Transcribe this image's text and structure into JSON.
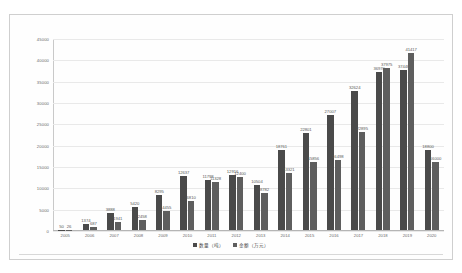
{
  "chart_data": {
    "type": "bar",
    "title": "",
    "xlabel": "",
    "ylabel": "",
    "ylim": [
      0,
      45000
    ],
    "grid": true,
    "legend_position": "bottom",
    "categories": [
      "2005",
      "2006",
      "2007",
      "2008",
      "2009",
      "2010",
      "2011",
      "2012",
      "2013",
      "2014",
      "2015",
      "2016",
      "2017",
      "2018",
      "2019",
      "2020"
    ],
    "yticks": [
      "0",
      "5000",
      "10000",
      "15000",
      "20000",
      "25000",
      "30000",
      "35000",
      "40000",
      "45000"
    ],
    "ytick_values": [
      0,
      5000,
      10000,
      15000,
      20000,
      25000,
      30000,
      35000,
      40000,
      45000
    ],
    "series": [
      {
        "name": "数量（吨）",
        "color": "#4a4a4a",
        "values": [
          50,
          1374,
          3888,
          5420,
          8295,
          12637,
          11798,
          12916,
          10504,
          18761,
          22801,
          27007,
          32624,
          36970,
          37448,
          18800
        ],
        "labels": [
          "50",
          "1374",
          "3888",
          "5420",
          "8295",
          "12637",
          "11798",
          "12916",
          "10504",
          "18761",
          "22801",
          "27007",
          "32624",
          "36970",
          "37448",
          "18800"
        ]
      },
      {
        "name": "金额（万元）",
        "color": "#5e5e5e",
        "values": [
          26,
          687,
          1941,
          2458,
          4455,
          6810,
          11328,
          12400,
          8782,
          13321,
          15856,
          16498,
          22895,
          37975,
          41417,
          16000
        ],
        "labels": [
          "26",
          "687",
          "1941",
          "2458",
          "4455",
          "6810",
          "11328",
          "12400",
          "8782",
          "13321",
          "15856",
          "16498",
          "22895",
          "37975",
          "41417",
          "16000"
        ]
      }
    ]
  },
  "legend": {
    "items": [
      {
        "label": "数量（吨）"
      },
      {
        "label": "金额（万元）"
      }
    ]
  }
}
